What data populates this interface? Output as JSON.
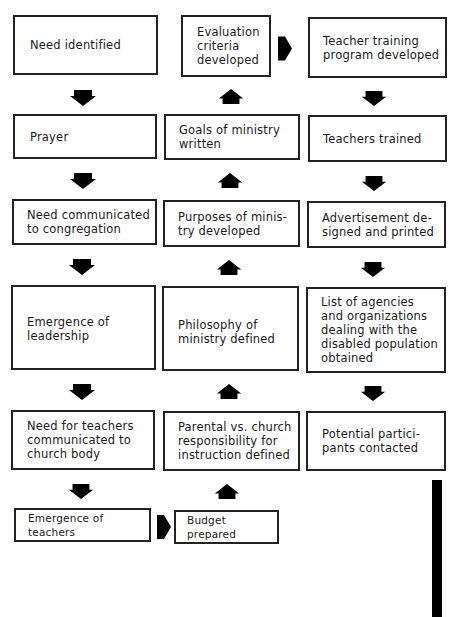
{
  "diagram": {
    "type": "flowchart",
    "columns": [
      {
        "name": "left",
        "direction": "down",
        "steps": [
          "Need identified",
          "Prayer",
          "Need communicated\nto congregation",
          "Emergence of\nleadership",
          "Need for teachers\ncommunicated to\nchurch body",
          "Emergence of teachers"
        ]
      },
      {
        "name": "middle",
        "direction": "up",
        "steps": [
          "Budget prepared",
          "Parental vs. church\nresponsibility for\ninstruction defined",
          "Philosophy of\nministry defined",
          "Purposes of minis-\ntry developed",
          "Goals of ministry\nwritten",
          "Evaluation\ncriteria\ndeveloped"
        ]
      },
      {
        "name": "right",
        "direction": "down",
        "steps": [
          "Teacher training\nprogram developed",
          "Teachers trained",
          "Advertisement de-\nsigned and printed",
          "List of agencies\nand organizations\ndealing with the\ndisabled population\nobtained",
          "Potential partici-\npants contacted"
        ]
      }
    ],
    "connections": [
      {
        "from": "Emergence of teachers",
        "to": "Budget prepared",
        "arrow": "right"
      },
      {
        "from": "Evaluation criteria developed",
        "to": "Teacher training program developed",
        "arrow": "right"
      }
    ],
    "colors": {
      "border": "#222222",
      "arrow": "#000000",
      "background": "#ffffff"
    }
  }
}
